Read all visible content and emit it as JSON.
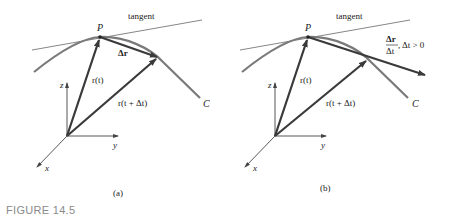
{
  "figure": {
    "caption": "FIGURE 14.5",
    "panels": [
      {
        "id": "a",
        "sublabel": "(a)",
        "tangent_label": "tangent",
        "point_label": "P",
        "curve_label": "C",
        "vector_rt": "r(t)",
        "vector_rtdt": "r(t + Δt)",
        "delta_label": "Δr",
        "axes": {
          "z": "z",
          "y": "y",
          "x": "x"
        }
      },
      {
        "id": "b",
        "sublabel": "(b)",
        "tangent_label": "tangent",
        "point_label": "P",
        "curve_label": "C",
        "vector_rt": "r(t)",
        "vector_rtdt": "r(t + Δt)",
        "frac_num": "Δr",
        "frac_den": "Δt",
        "frac_cond": ", Δt > 0",
        "axes": {
          "z": "z",
          "y": "y",
          "x": "x"
        }
      }
    ],
    "colors": {
      "curve": "#7a7a7a",
      "vector": "#3a3a3a",
      "axis": "#444444",
      "tangent": "#666666"
    }
  }
}
